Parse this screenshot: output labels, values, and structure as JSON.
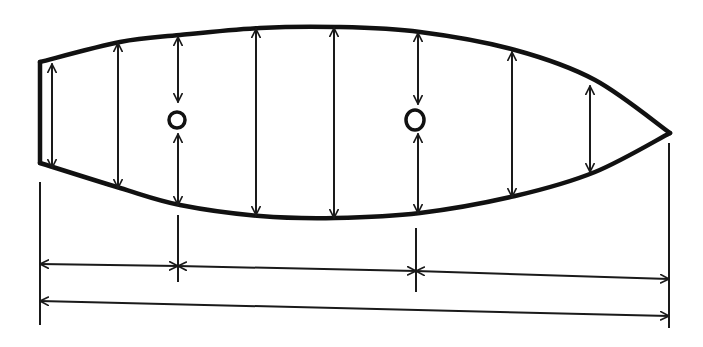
{
  "diagram": {
    "type": "technical-sketch",
    "colors": {
      "ink": "#111111",
      "background": "#ffffff"
    },
    "outline": {
      "top_edge": [
        [
          40,
          62
        ],
        [
          120,
          42
        ],
        [
          180,
          35
        ],
        [
          260,
          28
        ],
        [
          335,
          27
        ],
        [
          420,
          32
        ],
        [
          515,
          50
        ],
        [
          595,
          80
        ],
        [
          670,
          133
        ]
      ],
      "bottom_edge": [
        [
          670,
          133
        ],
        [
          595,
          172
        ],
        [
          515,
          196
        ],
        [
          420,
          213
        ],
        [
          335,
          218
        ],
        [
          260,
          216
        ],
        [
          180,
          205
        ],
        [
          120,
          188
        ],
        [
          40,
          163
        ]
      ],
      "left_edge": [
        [
          40,
          62
        ],
        [
          40,
          163
        ]
      ]
    },
    "vertical_dimensions": [
      {
        "x": 52,
        "top": 64,
        "bottom": 168
      },
      {
        "x": 118,
        "top": 43,
        "bottom": 188
      },
      {
        "x": 178,
        "top": 37,
        "bottom": 102,
        "note": "stops at hole"
      },
      {
        "x": 178,
        "top": 134,
        "bottom": 205,
        "note": "from hole to edge"
      },
      {
        "x": 256,
        "top": 29,
        "bottom": 215
      },
      {
        "x": 334,
        "top": 28,
        "bottom": 218
      },
      {
        "x": 418,
        "top": 33,
        "bottom": 104,
        "note": "stops at hole"
      },
      {
        "x": 418,
        "top": 134,
        "bottom": 213,
        "note": "from hole to edge"
      },
      {
        "x": 512,
        "top": 52,
        "bottom": 197
      },
      {
        "x": 590,
        "top": 86,
        "bottom": 172
      }
    ],
    "holes": [
      {
        "cx": 177,
        "cy": 120,
        "rx": 8,
        "ry": 8
      },
      {
        "cx": 415,
        "cy": 120,
        "rx": 9,
        "ry": 10
      }
    ],
    "extension_lines": [
      {
        "x": 40,
        "y1": 182,
        "y2": 325
      },
      {
        "x": 178,
        "y1": 215,
        "y2": 282
      },
      {
        "x": 416,
        "y1": 228,
        "y2": 292
      },
      {
        "x": 669,
        "y1": 143,
        "y2": 328
      }
    ],
    "horizontal_dimensions": [
      {
        "row": "hole positions",
        "segments": [
          {
            "x1": 40,
            "x2": 178,
            "y1": 264,
            "y2": 266
          },
          {
            "x1": 178,
            "x2": 416,
            "y1": 266,
            "y2": 271
          },
          {
            "x1": 416,
            "x2": 669,
            "y1": 271,
            "y2": 279
          }
        ]
      },
      {
        "row": "overall length",
        "segments": [
          {
            "x1": 40,
            "x2": 669,
            "y1": 301,
            "y2": 316
          }
        ]
      }
    ],
    "text_labels": []
  }
}
